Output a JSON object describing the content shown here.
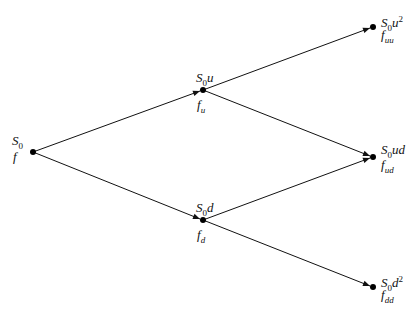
{
  "diagram": {
    "type": "binomial-tree",
    "colors": {
      "line": "#111111",
      "node": "#000000",
      "background": "#ffffff"
    },
    "nodes": [
      {
        "id": "root",
        "x": 33,
        "y": 152,
        "price_base": "S",
        "price_sub": "0",
        "price_suffix": "",
        "price_sup": "",
        "value_base": "f",
        "value_sub": ""
      },
      {
        "id": "u",
        "x": 203,
        "y": 90,
        "price_base": "S",
        "price_sub": "0",
        "price_suffix": "u",
        "price_sup": "",
        "value_base": "f",
        "value_sub": "u"
      },
      {
        "id": "d",
        "x": 203,
        "y": 220,
        "price_base": "S",
        "price_sub": "0",
        "price_suffix": "d",
        "price_sup": "",
        "value_base": "f",
        "value_sub": "d"
      },
      {
        "id": "uu",
        "x": 373,
        "y": 27,
        "price_base": "S",
        "price_sub": "0",
        "price_suffix": "u",
        "price_sup": "2",
        "value_base": "f",
        "value_sub": "uu"
      },
      {
        "id": "ud",
        "x": 373,
        "y": 157,
        "price_base": "S",
        "price_sub": "0",
        "price_suffix": "ud",
        "price_sup": "",
        "value_base": "f",
        "value_sub": "ud"
      },
      {
        "id": "dd",
        "x": 373,
        "y": 287,
        "price_base": "S",
        "price_sub": "0",
        "price_suffix": "d",
        "price_sup": "2",
        "value_base": "f",
        "value_sub": "dd"
      }
    ],
    "edges": [
      {
        "from": "root",
        "to": "u"
      },
      {
        "from": "root",
        "to": "d"
      },
      {
        "from": "u",
        "to": "uu"
      },
      {
        "from": "u",
        "to": "ud"
      },
      {
        "from": "d",
        "to": "ud"
      },
      {
        "from": "d",
        "to": "dd"
      }
    ]
  }
}
